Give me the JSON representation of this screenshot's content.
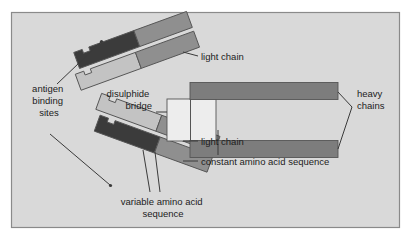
{
  "figure": {
    "frame": {
      "border_color": "#8a8a8a",
      "background_color": "#d9d9d9",
      "outer_background": "#ffffff",
      "x": 11,
      "y": 12,
      "width": 389,
      "height": 216
    },
    "palette": {
      "variable_heavy_dark": "#3b3b3b",
      "constant_mid_gray": "#8f8f8f",
      "light_chain_pale": "#c3c3c3",
      "heavy_chain_bar": "#7d7d7d",
      "hinge_white": "#ededed",
      "outline": "#555555",
      "leader": "#3a3a3a",
      "text": "#1c1c1c"
    },
    "labels": {
      "antigen_binding_sites": {
        "lines": [
          "antigen",
          "binding",
          "sites"
        ],
        "x": 49,
        "y": 92,
        "anchor": "middle",
        "line_height": 12
      },
      "disulphide_bridge": {
        "lines": [
          "disulphide",
          "bridge"
        ],
        "x": 152,
        "y": 97,
        "anchor": "end",
        "line_height": 12
      },
      "light_chain_top": {
        "lines": [
          "light chain"
        ],
        "x": 201,
        "y": 60,
        "anchor": "start",
        "line_height": 12
      },
      "light_chain_bottom": {
        "lines": [
          "light chain"
        ],
        "x": 201,
        "y": 145,
        "anchor": "start",
        "line_height": 12
      },
      "constant_amino_acid_sequence": {
        "lines": [
          "constant amino acid sequence"
        ],
        "x": 201,
        "y": 165,
        "anchor": "start",
        "line_height": 12
      },
      "variable_amino_acid_sequence": {
        "lines": [
          "variable amino acid",
          "sequence"
        ],
        "x": 163,
        "y": 205,
        "anchor": "middle",
        "line_height": 12
      },
      "heavy_chains": {
        "lines": [
          "heavy",
          "chains"
        ],
        "x": 357,
        "y": 97,
        "anchor": "start",
        "line_height": 12
      }
    },
    "parts": {
      "upper_heavy_variable": "upper-arm-variable-region-heavy-chain",
      "upper_heavy_constant": "upper-arm-constant-region-heavy-chain",
      "upper_light_variable": "upper-arm-variable-region-light-chain",
      "upper_light_constant": "upper-arm-constant-region-light-chain",
      "lower_heavy_variable": "lower-arm-variable-region-heavy-chain",
      "lower_heavy_constant": "lower-arm-constant-region-heavy-chain",
      "lower_light_variable": "lower-arm-variable-region-light-chain",
      "lower_light_constant": "lower-arm-constant-region-light-chain",
      "hinge": "hinge-disulphide-bridge-region",
      "heavy_chain_upper_bar": "upper-heavy-chain-bar",
      "heavy_chain_lower_bar": "lower-heavy-chain-bar"
    }
  }
}
